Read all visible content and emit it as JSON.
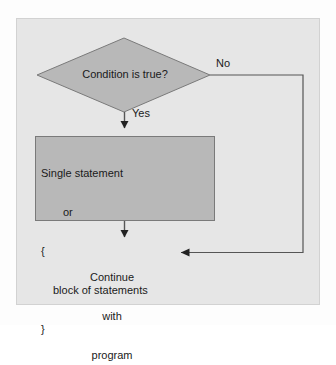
{
  "diagram": {
    "background_color": "#e6e6e6",
    "shape_fill_color": "#b8b8b8",
    "shape_stroke_color": "#7a7a7a",
    "line_color": "#555555",
    "text_color": "#1a1a1a",
    "decision": {
      "shape": "diamond",
      "label": "Condition is true?"
    },
    "process": {
      "shape": "rectangle",
      "lines": [
        "Single statement",
        "or",
        "{",
        "block of statements",
        "}"
      ]
    },
    "terminal": {
      "shape": "text",
      "lines": [
        "Continue",
        "with",
        "program"
      ]
    },
    "edges": {
      "yes_label": "Yes",
      "no_label": "No"
    }
  }
}
